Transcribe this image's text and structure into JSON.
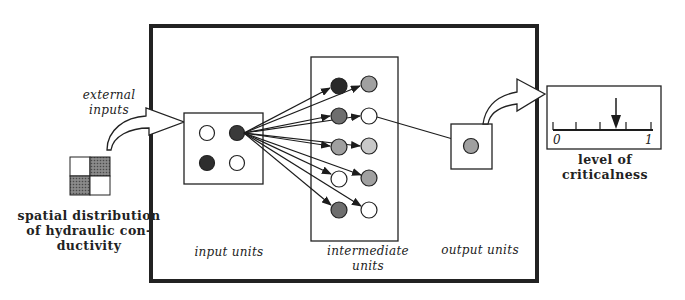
{
  "diagram": {
    "type": "neural-network-schematic",
    "colors": {
      "stroke": "#1c1c1c",
      "frame": "#222222",
      "node_black": "#2a2a2a",
      "node_dark": "#6e6e6e",
      "node_medium": "#a0a0a0",
      "node_light": "#c8c8c8",
      "node_white": "#ffffff",
      "grid_shaded": "#6a6a6a"
    },
    "labels": {
      "external_inputs_line1": "external",
      "external_inputs_line2": "inputs",
      "spatial_line1": "spatial distribution",
      "spatial_line2": "of hydraulic con-",
      "spatial_line3": "ductivity",
      "input_units": "input units",
      "intermediate_line1": "intermediate",
      "intermediate_line2": "units",
      "output_units": "output units",
      "level_line1": "level of",
      "level_line2": "criticalness",
      "scale_min": "0",
      "scale_max": "1"
    },
    "input_grid": [
      [
        "white",
        "shaded"
      ],
      [
        "shaded",
        "white"
      ]
    ],
    "input_units": [
      {
        "id": "in1",
        "shade": "white"
      },
      {
        "id": "in2",
        "shade": "black"
      },
      {
        "id": "in3",
        "shade": "black"
      },
      {
        "id": "in4",
        "shade": "white"
      }
    ],
    "intermediate_units": [
      {
        "id": "h1",
        "shade": "black"
      },
      {
        "id": "h2",
        "shade": "medium"
      },
      {
        "id": "h3",
        "shade": "dark"
      },
      {
        "id": "h4",
        "shade": "white"
      },
      {
        "id": "h5",
        "shade": "medium"
      },
      {
        "id": "h6",
        "shade": "light"
      },
      {
        "id": "h7",
        "shade": "white"
      },
      {
        "id": "h8",
        "shade": "medium"
      },
      {
        "id": "h9",
        "shade": "dark"
      },
      {
        "id": "h10",
        "shade": "white"
      }
    ],
    "output_units": [
      {
        "id": "out1",
        "shade": "medium"
      }
    ],
    "gauge": {
      "min": 0,
      "max": 1,
      "ticks": 5,
      "pointer_value": 0.63
    }
  }
}
